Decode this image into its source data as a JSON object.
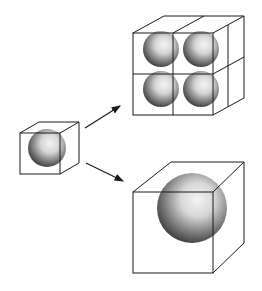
{
  "diagram": {
    "type": "cube-scaling-illustration",
    "colors": {
      "background": "#ffffff",
      "line": "#1a1a1a",
      "sphere_dark": "#2b2b2b",
      "sphere_light": "#f2f2f2"
    },
    "nodes": [
      {
        "id": "small-cube",
        "label": "",
        "spheres": 1
      },
      {
        "id": "subdivided-cube",
        "label": "",
        "spheres": 4,
        "grid": "2x2"
      },
      {
        "id": "large-cube",
        "label": "",
        "spheres": 1
      }
    ],
    "edges": [
      {
        "from": "small-cube",
        "to": "subdivided-cube",
        "label": ""
      },
      {
        "from": "small-cube",
        "to": "large-cube",
        "label": ""
      }
    ]
  }
}
